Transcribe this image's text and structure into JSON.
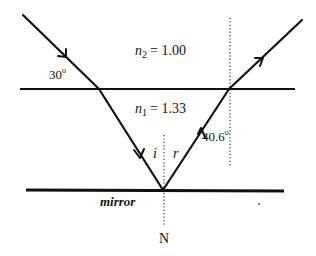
{
  "diagram": {
    "media": {
      "upper": {
        "label_symbol": "n",
        "label_subscript": "2",
        "label_value": "= 1.00"
      },
      "lower": {
        "label_symbol": "n",
        "label_subscript": "1",
        "label_value": "= 1.33"
      }
    },
    "angles": {
      "incident_to_surface": "30",
      "exit_to_normal": "40.6",
      "degree_symbol": "o",
      "incidence_label": "i",
      "reflection_label": "r"
    },
    "mirror_label": "mirror",
    "normal_label": "N",
    "colors": {
      "line": "#111111",
      "background": "#ffffff"
    }
  }
}
